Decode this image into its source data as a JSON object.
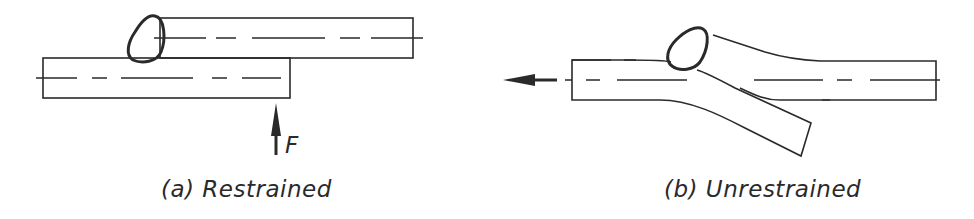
{
  "figure": {
    "panels": [
      {
        "id": "a",
        "caption": "(a) Restrained",
        "force_label": "F",
        "description": "Two overlapping plates joined by a fillet weld; lower plate held by upward force F"
      },
      {
        "id": "b",
        "caption": "(b) Unrestrained",
        "description": "Two overlapping plates joined by a fillet weld; plates rotate/bend under axial pull"
      }
    ],
    "colors": {
      "line": "#2a2a2a",
      "background": "#ffffff"
    }
  }
}
